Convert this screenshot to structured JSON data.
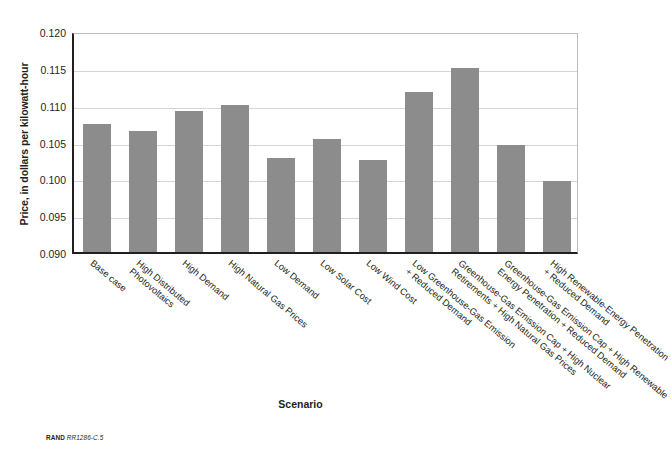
{
  "chart_data": {
    "type": "bar",
    "title": "",
    "xlabel": "Scenario",
    "ylabel": "Price, in dollars per kilowatt-hour",
    "ylim": [
      0.09,
      0.12
    ],
    "ytick_step": 0.005,
    "yticks": [
      "0.120",
      "0.115",
      "0.110",
      "0.105",
      "0.100",
      "0.095",
      "0.090"
    ],
    "ytick_values": [
      0.12,
      0.115,
      0.11,
      0.105,
      0.1,
      0.095,
      0.09
    ],
    "grid": true,
    "legend": "none",
    "bar_color": "#8c8c8c",
    "categories": [
      "Base case",
      "High Distributed\nPhotovoltaics",
      "High Demand",
      "High Natural Gas Prices",
      "Low Demand",
      "Low Solar Cost",
      "Low Wind Cost",
      "Low Greenhouse-Gas Emission\n+ Reduced Demand",
      "Greenhouse-Gas Emission Cap + High Nuclear\nRetirements + High Natural Gas Prices",
      "Greenhouse-Gas Emission Cap + High Renewable\nEnergy Penetration + Reduced Demand",
      "High Renewable-Energy Penetration\n+ Reduced Demand"
    ],
    "values": [
      0.1074,
      0.1064,
      0.1091,
      0.11,
      0.1027,
      0.1054,
      0.1025,
      0.1117,
      0.115,
      0.1045,
      0.0997
    ]
  },
  "caption": {
    "source": "RAND",
    "code": "RR1286-C.5"
  }
}
